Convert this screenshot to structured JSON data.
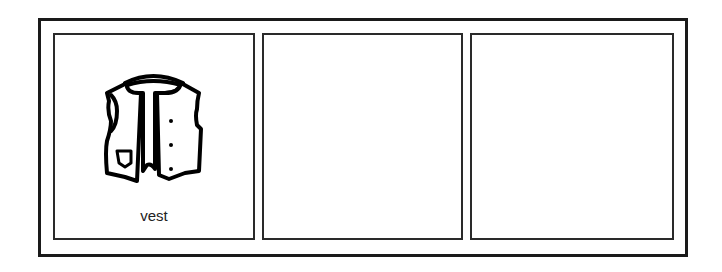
{
  "cards": [
    {
      "label": "vest",
      "icon": "vest-icon"
    },
    {
      "label": "",
      "icon": ""
    },
    {
      "label": "",
      "icon": ""
    }
  ],
  "colors": {
    "frame": "#1a1a1a",
    "card_border": "#2a2a2a",
    "background": "#ffffff"
  }
}
